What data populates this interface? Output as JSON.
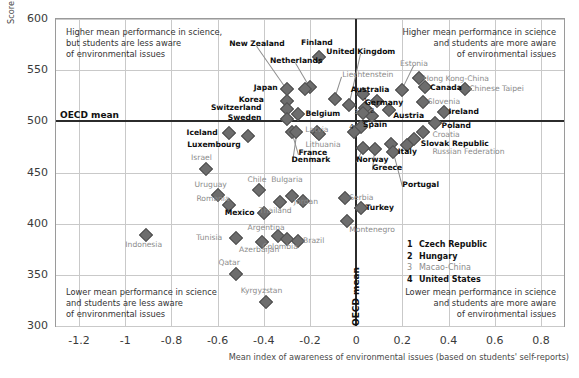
{
  "chart_data": {
    "type": "scatter",
    "title": "",
    "xlabel": "Mean index of awareness of environmental issues (based on students' self-reports)",
    "ylabel": "Score",
    "xlim": [
      -1.3,
      0.9
    ],
    "ylim": [
      300,
      600
    ],
    "xticks": [
      "-1.2",
      "-1",
      "-0.8",
      "-0.6",
      "-0.4",
      "-0.2",
      "0",
      "0.2",
      "0.4",
      "0.6",
      "0.8"
    ],
    "xtickvals": [
      -1.2,
      -1,
      -0.8,
      -0.6,
      -0.4,
      -0.2,
      0,
      0.2,
      0.4,
      0.6,
      0.8
    ],
    "yticks": [
      "600",
      "550",
      "500",
      "450",
      "400",
      "350",
      "300"
    ],
    "ytickvals": [
      600,
      550,
      500,
      450,
      400,
      350,
      300
    ],
    "grid": true,
    "reference_lines": {
      "horizontal": {
        "label": "OECD mean",
        "value": 500
      },
      "vertical": {
        "label": "OECD mean",
        "value": 0
      }
    },
    "quadrant_notes": {
      "top_left": "Higher mean performance in science,\nbut students are less aware\nof environmental issues",
      "top_right": "Higher mean performance in science\nand students are more aware\nof environmental issues",
      "bottom_left": "Lower mean performance in science\nand students are less aware\nof environmental issues",
      "bottom_right": "Lower mean performance in science\nand students are more aware\nof environmental issues"
    },
    "marker_color": "#6d6d6d",
    "points": [
      {
        "name": "New Zealand",
        "x": -0.3,
        "y": 532,
        "lx": -0.43,
        "ly": 576,
        "style": "b",
        "align": "center",
        "lead": true
      },
      {
        "name": "Finland",
        "x": -0.16,
        "y": 563,
        "lx": -0.17,
        "ly": 577,
        "style": "b",
        "align": "center",
        "lead": false
      },
      {
        "name": "Netherlands",
        "x": -0.2,
        "y": 534,
        "lx": -0.26,
        "ly": 559,
        "style": "b",
        "align": "center",
        "lead": true
      },
      {
        "name": "Japan",
        "x": -0.22,
        "y": 532,
        "lx": -0.34,
        "ly": 533,
        "style": "b",
        "align": "right",
        "lead": false
      },
      {
        "name": "Korea",
        "x": -0.3,
        "y": 520,
        "lx": -0.4,
        "ly": 521,
        "style": "b",
        "align": "right",
        "lead": false
      },
      {
        "name": "Switzerland",
        "x": -0.3,
        "y": 512,
        "lx": -0.41,
        "ly": 513,
        "style": "b",
        "align": "right",
        "lead": false
      },
      {
        "name": "Sweden",
        "x": -0.3,
        "y": 502,
        "lx": -0.41,
        "ly": 503,
        "style": "b",
        "align": "right",
        "lead": false
      },
      {
        "name": "Belgium",
        "x": -0.25,
        "y": 507,
        "lx": -0.22,
        "ly": 507,
        "style": "b",
        "align": "left",
        "lead": false
      },
      {
        "name": "Iceland",
        "x": -0.55,
        "y": 489,
        "lx": -0.6,
        "ly": 489,
        "style": "b",
        "align": "right",
        "lead": false
      },
      {
        "name": "Luxembourg",
        "x": -0.47,
        "y": 486,
        "lx": -0.5,
        "ly": 477,
        "style": "b",
        "align": "right",
        "lead": false
      },
      {
        "name": "Latvia",
        "x": -0.17,
        "y": 490,
        "lx": -0.17,
        "ly": 492,
        "style": "g",
        "align": "center",
        "lead": false
      },
      {
        "name": "Lithuania",
        "x": -0.16,
        "y": 488,
        "lx": -0.22,
        "ly": 477,
        "style": "g",
        "align": "left",
        "lead": false
      },
      {
        "name": "France",
        "x": -0.28,
        "y": 490,
        "lx": -0.25,
        "ly": 469,
        "style": "b",
        "align": "left",
        "lead": true
      },
      {
        "name": "Denmark",
        "x": -0.26,
        "y": 490,
        "lx": -0.28,
        "ly": 462,
        "style": "b",
        "align": "left",
        "lead": true
      },
      {
        "name": "Israel",
        "x": -0.65,
        "y": 453,
        "lx": -0.67,
        "ly": 464,
        "style": "g",
        "align": "center",
        "lead": false
      },
      {
        "name": "Liechtenstein",
        "x": -0.09,
        "y": 522,
        "lx": -0.06,
        "ly": 545,
        "style": "g",
        "align": "left",
        "lead": true
      },
      {
        "name": "United Kingdom",
        "x": -0.03,
        "y": 516,
        "lx": 0.02,
        "ly": 568,
        "style": "b",
        "align": "center",
        "lead": true
      },
      {
        "name": "Australia",
        "x": 0.03,
        "y": 527,
        "lx": 0.06,
        "ly": 531,
        "style": "b",
        "align": "center",
        "lead": false
      },
      {
        "name": "Germany",
        "x": 0.09,
        "y": 520,
        "lx": 0.12,
        "ly": 518,
        "style": "b",
        "align": "center",
        "lead": false
      },
      {
        "name": "Estonia",
        "x": 0.2,
        "y": 531,
        "lx": 0.25,
        "ly": 556,
        "style": "g",
        "align": "center",
        "lead": true
      },
      {
        "name": "Hong Kong-China",
        "x": 0.27,
        "y": 542,
        "lx": 0.29,
        "ly": 541,
        "style": "g",
        "align": "left",
        "lead": false
      },
      {
        "name": "Canada",
        "x": 0.3,
        "y": 534,
        "lx": 0.32,
        "ly": 533,
        "style": "b",
        "align": "left",
        "lead": false
      },
      {
        "name": "Chinese Taipei",
        "x": 0.47,
        "y": 532,
        "lx": 0.49,
        "ly": 532,
        "style": "g",
        "align": "left",
        "lead": false
      },
      {
        "name": "Slovenia",
        "x": 0.29,
        "y": 519,
        "lx": 0.31,
        "ly": 519,
        "style": "g",
        "align": "left",
        "lead": false
      },
      {
        "name": "Ireland",
        "x": 0.38,
        "y": 509,
        "lx": 0.4,
        "ly": 509,
        "style": "b",
        "align": "left",
        "lead": false
      },
      {
        "name": "Austria",
        "x": 0.14,
        "y": 511,
        "lx": 0.16,
        "ly": 505,
        "style": "b",
        "align": "left",
        "lead": false
      },
      {
        "name": "Spain",
        "x": 0.02,
        "y": 494,
        "lx": 0.03,
        "ly": 496,
        "style": "b",
        "align": "left",
        "lead": false
      },
      {
        "name": "Poland",
        "x": 0.34,
        "y": 498,
        "lx": 0.37,
        "ly": 495,
        "style": "b",
        "align": "left",
        "lead": false
      },
      {
        "name": "Croatia",
        "x": 0.29,
        "y": 490,
        "lx": 0.33,
        "ly": 487,
        "style": "g",
        "align": "left",
        "lead": false
      },
      {
        "name": "Slovak Republic",
        "x": 0.25,
        "y": 483,
        "lx": 0.28,
        "ly": 478,
        "style": "b",
        "align": "left",
        "lead": false
      },
      {
        "name": "Russian Federation",
        "x": 0.22,
        "y": 477,
        "lx": 0.33,
        "ly": 470,
        "style": "g",
        "align": "left",
        "lead": false
      },
      {
        "name": "Italy",
        "x": 0.15,
        "y": 478,
        "lx": 0.18,
        "ly": 470,
        "style": "b",
        "align": "left",
        "lead": false
      },
      {
        "name": "Norway",
        "x": 0.03,
        "y": 474,
        "lx": 0.0,
        "ly": 462,
        "style": "b",
        "align": "left",
        "lead": true
      },
      {
        "name": "Greece",
        "x": 0.08,
        "y": 473,
        "lx": 0.07,
        "ly": 454,
        "style": "b",
        "align": "left",
        "lead": true
      },
      {
        "name": "Portugal",
        "x": 0.16,
        "y": 470,
        "lx": 0.2,
        "ly": 438,
        "style": "b",
        "align": "left",
        "lead": true
      },
      {
        "name": "Chile",
        "x": -0.42,
        "y": 433,
        "lx": -0.43,
        "ly": 443,
        "style": "g",
        "align": "center",
        "lead": false
      },
      {
        "name": "Bulgaria",
        "x": -0.28,
        "y": 427,
        "lx": -0.3,
        "ly": 443,
        "style": "g",
        "align": "center",
        "lead": false
      },
      {
        "name": "Uruguay",
        "x": -0.6,
        "y": 428,
        "lx": -0.63,
        "ly": 438,
        "style": "g",
        "align": "center",
        "lead": false
      },
      {
        "name": "Romania",
        "x": -0.55,
        "y": 418,
        "lx": -0.62,
        "ly": 424,
        "style": "g",
        "align": "center",
        "lead": false
      },
      {
        "name": "Mexico",
        "x": -0.4,
        "y": 410,
        "lx": -0.44,
        "ly": 410,
        "style": "b",
        "align": "right",
        "lead": false
      },
      {
        "name": "Jordan",
        "x": -0.23,
        "y": 422,
        "lx": -0.27,
        "ly": 421,
        "style": "g",
        "align": "left",
        "lead": false
      },
      {
        "name": "Thailand",
        "x": -0.33,
        "y": 421,
        "lx": -0.35,
        "ly": 412,
        "style": "g",
        "align": "center",
        "lead": false
      },
      {
        "name": "Serbia",
        "x": -0.05,
        "y": 425,
        "lx": -0.03,
        "ly": 425,
        "style": "g",
        "align": "left",
        "lead": false
      },
      {
        "name": "Turkey",
        "x": 0.02,
        "y": 415,
        "lx": 0.04,
        "ly": 415,
        "style": "b",
        "align": "left",
        "lead": false
      },
      {
        "name": "Montenegro",
        "x": -0.04,
        "y": 403,
        "lx": -0.03,
        "ly": 394,
        "style": "g",
        "align": "left",
        "lead": false
      },
      {
        "name": "Argentina",
        "x": -0.34,
        "y": 388,
        "lx": -0.39,
        "ly": 396,
        "style": "g",
        "align": "center",
        "lead": false
      },
      {
        "name": "Brazil",
        "x": -0.25,
        "y": 383,
        "lx": -0.23,
        "ly": 383,
        "style": "g",
        "align": "left",
        "lead": false
      },
      {
        "name": "Colombia",
        "x": -0.3,
        "y": 385,
        "lx": -0.33,
        "ly": 377,
        "style": "g",
        "align": "center",
        "lead": false
      },
      {
        "name": "Azerbaijan",
        "x": -0.41,
        "y": 382,
        "lx": -0.42,
        "ly": 374,
        "style": "g",
        "align": "center",
        "lead": false
      },
      {
        "name": "Tunisia",
        "x": -0.52,
        "y": 386,
        "lx": -0.58,
        "ly": 386,
        "style": "g",
        "align": "right",
        "lead": false
      },
      {
        "name": "Indonesia",
        "x": -0.91,
        "y": 389,
        "lx": -0.92,
        "ly": 379,
        "style": "g",
        "align": "center",
        "lead": false
      },
      {
        "name": "Qatar",
        "x": -0.52,
        "y": 351,
        "lx": -0.55,
        "ly": 362,
        "style": "g",
        "align": "center",
        "lead": false
      },
      {
        "name": "Kyrgyzstan",
        "x": -0.39,
        "y": 323,
        "lx": -0.41,
        "ly": 334,
        "style": "g",
        "align": "center",
        "lead": false
      },
      {
        "name": "1",
        "x": 0.04,
        "y": 513,
        "lx": 0.04,
        "ly": 519,
        "style": "num",
        "align": "center",
        "lead": false
      },
      {
        "name": "2",
        "x": 0.07,
        "y": 505,
        "lx": 0.07,
        "ly": 509,
        "style": "num",
        "align": "center",
        "lead": false
      },
      {
        "name": "3",
        "x": 0.03,
        "y": 508,
        "lx": 0.0,
        "ly": 508,
        "style": "num g",
        "align": "center",
        "lead": false
      },
      {
        "name": "4",
        "x": -0.01,
        "y": 490,
        "lx": -0.02,
        "ly": 493,
        "style": "num",
        "align": "center",
        "lead": false
      }
    ],
    "footnote_legend": [
      {
        "num": "1",
        "label": "Czech Republic",
        "style": "bold"
      },
      {
        "num": "2",
        "label": "Hungary",
        "style": "bold"
      },
      {
        "num": "3",
        "label": "Macao-China",
        "style": "gray"
      },
      {
        "num": "4",
        "label": "United States",
        "style": "bold"
      }
    ]
  }
}
